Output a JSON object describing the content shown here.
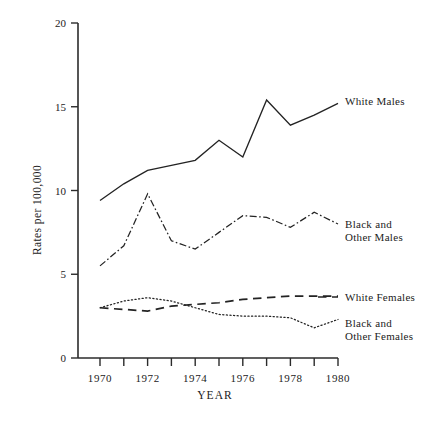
{
  "chart_data": {
    "type": "line",
    "title": "",
    "xlabel": "YEAR",
    "ylabel": "Rates per 100,000",
    "x": [
      1970,
      1971,
      1972,
      1973,
      1974,
      1975,
      1976,
      1977,
      1978,
      1979,
      1980
    ],
    "xtick_labels": [
      "1970",
      "1972",
      "1974",
      "1976",
      "1978",
      "1980"
    ],
    "xtick_values": [
      1970,
      1972,
      1974,
      1976,
      1978,
      1980
    ],
    "ytick_labels": [
      "0",
      "5",
      "10",
      "15",
      "20"
    ],
    "ytick_values": [
      0,
      5,
      10,
      15,
      20
    ],
    "xlim": [
      1969.3,
      1980.4
    ],
    "ylim": [
      0,
      20
    ],
    "grid": false,
    "legend_position": "right-inline",
    "series": [
      {
        "name": "White Males",
        "label": "White Males",
        "linestyle": "solid",
        "color": "#232323",
        "values": [
          9.4,
          10.4,
          11.2,
          11.5,
          11.8,
          13.0,
          12.0,
          15.4,
          13.9,
          14.5,
          15.2
        ]
      },
      {
        "name": "Black and Other Males",
        "label_line1": "Black and",
        "label_line2": "Other Males",
        "linestyle": "dash-dot",
        "color": "#232323",
        "values": [
          5.5,
          6.7,
          9.8,
          7.0,
          6.5,
          7.5,
          8.5,
          8.4,
          7.8,
          8.7,
          8.0
        ]
      },
      {
        "name": "White Females",
        "label": "White Females",
        "linestyle": "dashed",
        "color": "#232323",
        "values": [
          3.0,
          2.9,
          2.8,
          3.1,
          3.2,
          3.3,
          3.5,
          3.6,
          3.7,
          3.7,
          3.7
        ]
      },
      {
        "name": "Black and Other Females",
        "label_line1": "Black and",
        "label_line2": "Other Females",
        "linestyle": "dotted",
        "color": "#232323",
        "values": [
          3.0,
          3.4,
          3.6,
          3.4,
          3.0,
          2.6,
          2.5,
          2.5,
          2.4,
          1.8,
          2.3
        ]
      }
    ]
  }
}
